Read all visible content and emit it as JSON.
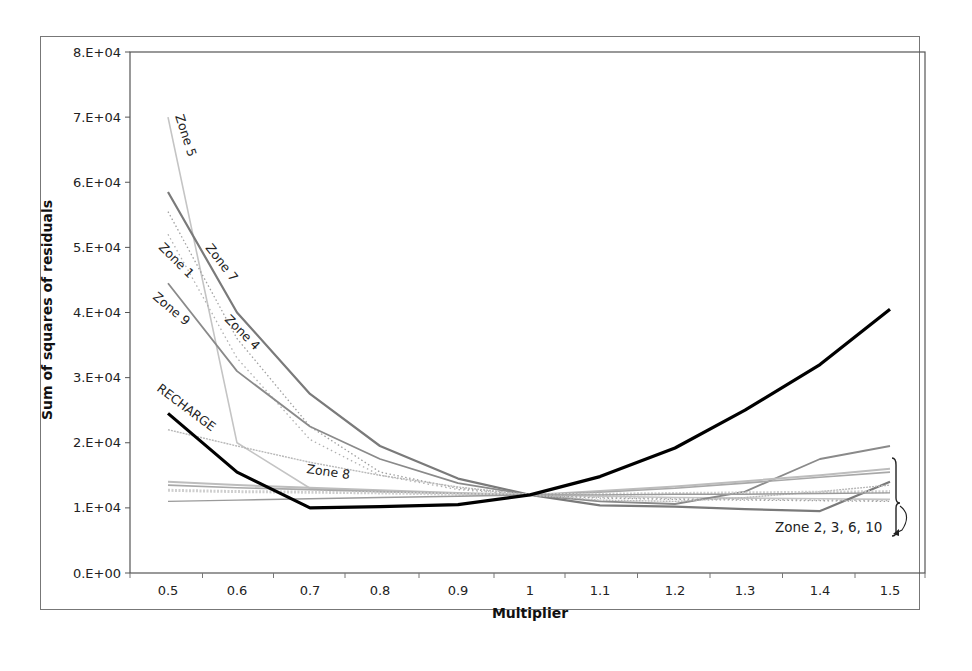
{
  "chart_data": {
    "type": "line",
    "title": "",
    "xlabel": "Multiplier",
    "ylabel": "Sum of squares of residuals",
    "x": [
      0.5,
      0.6,
      0.7,
      0.8,
      0.9,
      1.0,
      1.1,
      1.2,
      1.3,
      1.4,
      1.5
    ],
    "x_tick_labels": [
      "0.5",
      "0.6",
      "0.7",
      "0.8",
      "0.9",
      "1",
      "1.1",
      "1.2",
      "1.3",
      "1.4",
      "1.5"
    ],
    "y_tick_labels": [
      "0.E+00",
      "1.E+04",
      "2.E+04",
      "3.E+04",
      "4.E+04",
      "5.E+04",
      "6.E+04",
      "7.E+04",
      "8.E+04"
    ],
    "ylim": [
      0,
      80000
    ],
    "grid": false,
    "legend": "inline labels",
    "series": [
      {
        "name": "RECHARGE",
        "values": [
          24500,
          15500,
          10000,
          10200,
          10500,
          12000,
          14800,
          19200,
          25000,
          32000,
          40500
        ]
      },
      {
        "name": "Zone 5",
        "values": [
          70000,
          20000,
          13000,
          12500,
          12200,
          12000,
          11800,
          11600,
          11500,
          11400,
          11300
        ]
      },
      {
        "name": "Zone 7",
        "values": [
          58500,
          40000,
          27500,
          19500,
          14500,
          12000,
          10400,
          10200,
          9800,
          9500,
          14000
        ]
      },
      {
        "name": "Zone 1",
        "values": [
          55500,
          36000,
          22500,
          15500,
          13000,
          12000,
          11500,
          11300,
          11200,
          11100,
          11000
        ]
      },
      {
        "name": "Zone 4",
        "values": [
          52000,
          33000,
          20500,
          15000,
          12800,
          12000,
          11600,
          11400,
          11300,
          11200,
          11100
        ]
      },
      {
        "name": "Zone 9",
        "values": [
          44500,
          31000,
          22500,
          17500,
          13800,
          12000,
          11000,
          10600,
          12500,
          17500,
          19500
        ]
      },
      {
        "name": "Zone 8",
        "values": [
          22000,
          19500,
          17000,
          15000,
          13200,
          12000,
          11200,
          11000,
          11600,
          12500,
          13500
        ]
      },
      {
        "name": "Zone 2",
        "values": [
          14000,
          13500,
          13100,
          12700,
          12300,
          12000,
          12600,
          13300,
          14100,
          15000,
          16000
        ]
      },
      {
        "name": "Zone 3",
        "values": [
          13500,
          13100,
          12800,
          12500,
          12200,
          12000,
          12400,
          13000,
          13800,
          14700,
          15500
        ]
      },
      {
        "name": "Zone 6",
        "values": [
          12700,
          12500,
          12400,
          12300,
          12100,
          12000,
          12100,
          12200,
          12300,
          12400,
          12500
        ]
      },
      {
        "name": "Zone 10",
        "values": [
          11000,
          11200,
          11400,
          11600,
          11800,
          12000,
          12000,
          12100,
          12100,
          12200,
          12300
        ]
      }
    ],
    "annotations": [
      {
        "text": "Zone 5",
        "near": "x=0.52, y=6.5E+04"
      },
      {
        "text": "Zone 7",
        "near": "x=0.62, y=4.8E+04"
      },
      {
        "text": "Zone 1",
        "near": "x=0.55, y=4.8E+04"
      },
      {
        "text": "Zone 4",
        "near": "x=0.63, y=4.0E+04"
      },
      {
        "text": "Zone 9",
        "near": "x=0.53, y=4.3E+04"
      },
      {
        "text": "RECHARGE",
        "near": "x=0.56, y=2.7E+04"
      },
      {
        "text": "Zone 8",
        "near": "x=0.82, y=1.7E+04"
      },
      {
        "text": "Zone 2, 3, 6, 10",
        "near": "x=1.45, y=0.95E+04",
        "bracket": true
      }
    ]
  },
  "labels": {
    "x_axis_title": "Multiplier",
    "y_axis_title": "Sum of squares of residuals",
    "zone5": "Zone 5",
    "zone7": "Zone 7",
    "zone1": "Zone 1",
    "zone4": "Zone 4",
    "zone9": "Zone 9",
    "recharge": "RECHARGE",
    "zone8": "Zone 8",
    "group": "Zone 2, 3, 6, 10"
  }
}
